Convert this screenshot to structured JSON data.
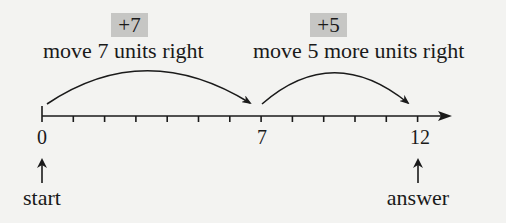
{
  "diagram": {
    "steps": [
      {
        "operation": "+7",
        "caption": "move 7 units right",
        "from": 0,
        "to": 7
      },
      {
        "operation": "+5",
        "caption": "move 5 more units right",
        "from": 7,
        "to": 12
      }
    ],
    "number_line": {
      "min": 0,
      "max": 12,
      "tick_step": 1,
      "labeled_ticks": [
        "0",
        "7",
        "12"
      ]
    },
    "markers": {
      "start": {
        "value": 0,
        "label": "start"
      },
      "answer": {
        "value": 12,
        "label": "answer"
      }
    },
    "colors": {
      "background": "#f3f3f1",
      "badge": "#c6c6c4",
      "ink": "#1a1a1a"
    }
  }
}
